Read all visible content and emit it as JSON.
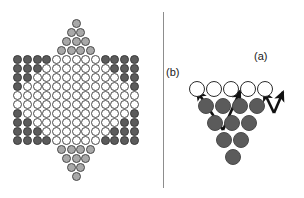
{
  "figure": {
    "panels": [
      "star-board",
      "jump-diagram"
    ],
    "divider": true
  },
  "colors": {
    "hole_fill": "#ffffff",
    "hole_stroke": "#4a4a4a",
    "dark_fill": "#5b5b5b",
    "dark_stroke": "#3a3a3a",
    "grey_fill": "#a9a9a9",
    "grey_stroke": "#4a4a4a",
    "arrow": "#111111",
    "divider": "#8d8d8d",
    "background": "#ffffff",
    "label_text": "#1a1a1a"
  },
  "star_board": {
    "name": "chinese-checkers-star",
    "row_count": 17,
    "legend": {
      "hole": "empty hole",
      "dark": "dark piece (left and right star points)",
      "grey": "light-grey piece (top and bottom star points)"
    },
    "rows": [
      {
        "index": 0,
        "y": 18,
        "cells": [
          "grey"
        ]
      },
      {
        "index": 1,
        "y": 27,
        "cells": [
          "grey",
          "grey"
        ]
      },
      {
        "index": 2,
        "y": 36,
        "cells": [
          "grey",
          "grey",
          "grey"
        ]
      },
      {
        "index": 3,
        "y": 45,
        "cells": [
          "grey",
          "grey",
          "grey",
          "grey"
        ]
      },
      {
        "index": 4,
        "y": 54,
        "cells": [
          "dark",
          "dark",
          "dark",
          "dark",
          "hole",
          "hole",
          "hole",
          "hole",
          "hole",
          "dark",
          "dark",
          "dark",
          "dark"
        ]
      },
      {
        "index": 5,
        "y": 63,
        "cells": [
          "dark",
          "dark",
          "dark",
          "hole",
          "hole",
          "hole",
          "hole",
          "hole",
          "hole",
          "hole",
          "dark",
          "dark",
          "dark"
        ]
      },
      {
        "index": 6,
        "y": 72,
        "cells": [
          "dark",
          "dark",
          "hole",
          "hole",
          "hole",
          "hole",
          "hole",
          "hole",
          "hole",
          "hole",
          "hole",
          "dark",
          "dark"
        ]
      },
      {
        "index": 7,
        "y": 81,
        "cells": [
          "dark",
          "hole",
          "hole",
          "hole",
          "hole",
          "hole",
          "hole",
          "hole",
          "hole",
          "hole",
          "hole",
          "hole",
          "dark"
        ]
      },
      {
        "index": 8,
        "y": 90,
        "cells": [
          "hole",
          "hole",
          "hole",
          "hole",
          "hole",
          "hole",
          "hole",
          "hole",
          "hole",
          "hole",
          "hole",
          "hole",
          "hole"
        ]
      },
      {
        "index": 9,
        "y": 99,
        "cells": [
          "hole",
          "hole",
          "hole",
          "hole",
          "hole",
          "hole",
          "hole",
          "hole",
          "hole",
          "hole",
          "hole",
          "hole",
          "hole"
        ]
      },
      {
        "index": 10,
        "y": 108,
        "cells": [
          "dark",
          "hole",
          "hole",
          "hole",
          "hole",
          "hole",
          "hole",
          "hole",
          "hole",
          "hole",
          "hole",
          "hole",
          "dark"
        ]
      },
      {
        "index": 11,
        "y": 117,
        "cells": [
          "dark",
          "dark",
          "hole",
          "hole",
          "hole",
          "hole",
          "hole",
          "hole",
          "hole",
          "hole",
          "hole",
          "dark",
          "dark"
        ]
      },
      {
        "index": 12,
        "y": 126,
        "cells": [
          "dark",
          "dark",
          "dark",
          "hole",
          "hole",
          "hole",
          "hole",
          "hole",
          "hole",
          "hole",
          "dark",
          "dark",
          "dark"
        ]
      },
      {
        "index": 13,
        "y": 135,
        "cells": [
          "dark",
          "dark",
          "dark",
          "dark",
          "hole",
          "hole",
          "hole",
          "hole",
          "hole",
          "dark",
          "dark",
          "dark",
          "dark"
        ]
      },
      {
        "index": 14,
        "y": 144,
        "cells": [
          "grey",
          "grey",
          "grey",
          "grey"
        ]
      },
      {
        "index": 15,
        "y": 153,
        "cells": [
          "grey",
          "grey",
          "grey"
        ]
      },
      {
        "index": 16,
        "y": 162,
        "cells": [
          "grey",
          "grey"
        ]
      },
      {
        "index": 17,
        "y": 171,
        "cells": [
          "grey"
        ]
      }
    ]
  },
  "jump_diagram": {
    "name": "jump-move-diagram",
    "rows": [
      {
        "index": 0,
        "left": 36,
        "y": 80,
        "cells": [
          "hole",
          "hole",
          "hole",
          "hole",
          "hole"
        ]
      },
      {
        "index": 1,
        "left": 45,
        "y": 97,
        "cells": [
          "dark",
          "dark",
          "dark",
          "dark"
        ]
      },
      {
        "index": 2,
        "left": 54,
        "y": 114,
        "cells": [
          "dark",
          "dark",
          "dark"
        ]
      },
      {
        "index": 3,
        "left": 63,
        "y": 131,
        "cells": [
          "dark",
          "dark"
        ]
      },
      {
        "index": 4,
        "left": 72,
        "y": 148,
        "cells": [
          "dark"
        ]
      }
    ],
    "labels": [
      {
        "id": "a",
        "text": "(a)",
        "meaning": "single short jump"
      },
      {
        "id": "b",
        "text": "(b)",
        "meaning": "chained multi-jump"
      }
    ],
    "arrows": [
      {
        "id": "arrow-a-1",
        "from": [
          122,
          113
        ],
        "to": [
          112,
          92
        ],
        "label": "a"
      },
      {
        "id": "arrow-a-2",
        "from": [
          122,
          113
        ],
        "to": [
          131,
          92
        ],
        "label": "a"
      },
      {
        "id": "arrow-b-1",
        "from": [
          71,
          130
        ],
        "to": [
          45,
          91
        ],
        "label": "b"
      },
      {
        "id": "arrow-b-2",
        "from": [
          71,
          130
        ],
        "to": [
          88,
          91
        ],
        "label": "b"
      }
    ]
  }
}
